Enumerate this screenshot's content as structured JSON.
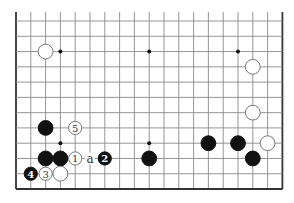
{
  "diagram": {
    "type": "go-board-partial",
    "board_size": 19,
    "visible_columns": [
      0,
      18
    ],
    "visible_rows_from_bottom": [
      1,
      12
    ],
    "open_edge": "top",
    "geometry": {
      "x0": 16,
      "dx": 14.8,
      "y_bottom": 189,
      "dy": 15.27
    },
    "colors": {
      "grid": "#8a8a8a",
      "edge": "#333333",
      "black_stone": "#111111",
      "white_stone_fill": "#ffffff",
      "white_stone_outline": "#777777"
    },
    "star_points": [
      {
        "col": 3,
        "row": 10
      },
      {
        "col": 9,
        "row": 10
      },
      {
        "col": 15,
        "row": 10
      },
      {
        "col": 3,
        "row": 4
      },
      {
        "col": 9,
        "row": 4
      },
      {
        "col": 15,
        "row": 4
      }
    ],
    "stones": [
      {
        "color": "white",
        "col": 2,
        "row": 10,
        "label": ""
      },
      {
        "color": "white",
        "col": 16,
        "row": 9,
        "label": ""
      },
      {
        "color": "white",
        "col": 16,
        "row": 6,
        "label": ""
      },
      {
        "color": "black",
        "col": 2,
        "row": 5,
        "label": ""
      },
      {
        "color": "white",
        "col": 4,
        "row": 5,
        "label": "5"
      },
      {
        "color": "black",
        "col": 2,
        "row": 3,
        "label": ""
      },
      {
        "color": "black",
        "col": 3,
        "row": 3,
        "label": ""
      },
      {
        "color": "white",
        "col": 4,
        "row": 3,
        "label": "1"
      },
      {
        "color": "black",
        "col": 6,
        "row": 3,
        "label": "2"
      },
      {
        "color": "black",
        "col": 9,
        "row": 3,
        "label": ""
      },
      {
        "color": "black",
        "col": 1,
        "row": 2,
        "label": "4"
      },
      {
        "color": "white",
        "col": 2,
        "row": 2,
        "label": "3"
      },
      {
        "color": "white",
        "col": 3,
        "row": 2,
        "label": ""
      },
      {
        "color": "black",
        "col": 13,
        "row": 4,
        "label": ""
      },
      {
        "color": "black",
        "col": 15,
        "row": 4,
        "label": ""
      },
      {
        "color": "white",
        "col": 17,
        "row": 4,
        "label": ""
      },
      {
        "color": "black",
        "col": 16,
        "row": 3,
        "label": ""
      }
    ],
    "markers": [
      {
        "text": "a",
        "col": 5,
        "row": 3
      }
    ]
  }
}
